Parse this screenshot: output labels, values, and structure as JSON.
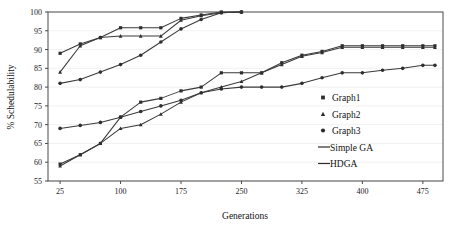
{
  "chart_data": {
    "type": "line",
    "title": "",
    "xlabel": "Generations",
    "ylabel": "% Schedulability",
    "xlim": [
      10,
      500
    ],
    "ylim": [
      55,
      100
    ],
    "xticks": [
      25,
      100,
      175,
      250,
      325,
      400,
      475
    ],
    "yticks": [
      55,
      60,
      65,
      70,
      75,
      80,
      85,
      90,
      95,
      100
    ],
    "grid": false,
    "legend_position": "right-inside",
    "legend": [
      {
        "label": "Graph1",
        "marker": "square"
      },
      {
        "label": "Graph2",
        "marker": "triangle"
      },
      {
        "label": "Graph3",
        "marker": "circle"
      },
      {
        "label": "Simple GA",
        "marker": "line"
      },
      {
        "label": "HDGA",
        "marker": "line"
      }
    ],
    "series": [
      {
        "name": "HDGA Graph1",
        "algorithm": "HDGA",
        "graph": "Graph1",
        "marker": "square",
        "x": [
          25,
          50,
          75,
          100,
          125,
          150,
          175,
          200,
          225,
          250
        ],
        "y": [
          89.0,
          91.5,
          93.2,
          95.8,
          95.8,
          95.8,
          98.3,
          99.2,
          100.0,
          100.0
        ]
      },
      {
        "name": "HDGA Graph2",
        "algorithm": "HDGA",
        "graph": "Graph2",
        "marker": "triangle",
        "x": [
          25,
          50,
          75,
          100,
          125,
          150,
          175,
          200,
          225,
          250
        ],
        "y": [
          84.0,
          91.0,
          93.2,
          93.6,
          93.6,
          93.6,
          97.8,
          99.0,
          99.8,
          100.0
        ]
      },
      {
        "name": "HDGA Graph3",
        "algorithm": "HDGA",
        "graph": "Graph3",
        "marker": "circle",
        "x": [
          25,
          50,
          75,
          100,
          125,
          150,
          175,
          200,
          225,
          250
        ],
        "y": [
          81.0,
          82.0,
          84.0,
          86.0,
          88.5,
          92.0,
          95.5,
          98.0,
          99.8,
          100.0
        ]
      },
      {
        "name": "Simple GA Graph1",
        "algorithm": "Simple GA",
        "graph": "Graph1",
        "marker": "square",
        "x": [
          25,
          50,
          75,
          100,
          125,
          150,
          175,
          200,
          225,
          250,
          275,
          300,
          325,
          350,
          375,
          400,
          425,
          450,
          475,
          490
        ],
        "y": [
          59.5,
          62.0,
          65.0,
          72.0,
          76.0,
          77.0,
          79.0,
          80.0,
          83.8,
          83.8,
          83.8,
          86.5,
          88.5,
          89.5,
          91.0,
          91.0,
          91.0,
          91.0,
          91.0,
          91.0
        ]
      },
      {
        "name": "Simple GA Graph2",
        "algorithm": "Simple GA",
        "graph": "Graph2",
        "marker": "triangle",
        "x": [
          25,
          50,
          75,
          100,
          125,
          150,
          175,
          200,
          225,
          250,
          275,
          300,
          325,
          350,
          375,
          400,
          425,
          450,
          475,
          490
        ],
        "y": [
          59.0,
          62.0,
          65.0,
          69.0,
          70.0,
          72.8,
          76.0,
          78.5,
          80.0,
          81.5,
          83.8,
          86.0,
          88.2,
          89.2,
          90.6,
          90.6,
          90.6,
          90.6,
          90.6,
          90.6
        ]
      },
      {
        "name": "Simple GA Graph3",
        "algorithm": "Simple GA",
        "graph": "Graph3",
        "marker": "circle",
        "x": [
          25,
          50,
          75,
          100,
          125,
          150,
          175,
          200,
          225,
          250,
          275,
          300,
          325,
          350,
          375,
          400,
          425,
          450,
          475,
          490
        ],
        "y": [
          69.0,
          69.8,
          70.6,
          72.0,
          73.5,
          75.0,
          76.5,
          78.5,
          79.5,
          80.0,
          80.0,
          80.0,
          81.0,
          82.5,
          83.8,
          83.8,
          84.5,
          85.0,
          85.8,
          85.8
        ]
      }
    ]
  }
}
